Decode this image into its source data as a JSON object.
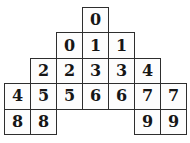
{
  "figure": {
    "cells": [
      "0",
      "0",
      "1",
      "1",
      "2",
      "2",
      "3",
      "3",
      "4",
      "4",
      "5",
      "5",
      "6",
      "6",
      "7",
      "7",
      "8",
      "8",
      "9",
      "9"
    ],
    "rows": [
      [
        "0"
      ],
      [
        "0",
        "1",
        "1"
      ],
      [
        "2",
        "2",
        "3",
        "3",
        "4"
      ],
      [
        "4",
        "5",
        "5",
        "6",
        "6",
        "7",
        "7"
      ],
      [
        "8",
        "8",
        "9",
        "9"
      ]
    ]
  },
  "colors": {
    "page_bg": "#ffffff",
    "cell_fill": "#fdfdfd",
    "border": "#2e2e2e",
    "digit": "#161616"
  }
}
